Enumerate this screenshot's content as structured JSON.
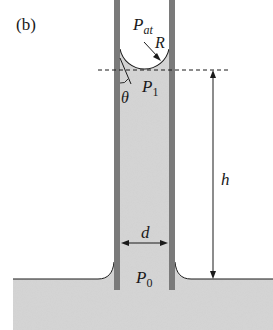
{
  "panel_label": "(b)",
  "labels": {
    "pressure_atmospheric": "P",
    "pressure_atmospheric_sub": "at",
    "radius": "R",
    "pressure_1": "P",
    "pressure_1_sub": "1",
    "contact_angle": "θ",
    "height": "h",
    "diameter": "d",
    "pressure_0": "P",
    "pressure_0_sub": "0"
  },
  "colors": {
    "liquid": "#d6d6d6",
    "tube_wall": "#7a7a7a",
    "line": "#1a1a1a",
    "background": "#ffffff"
  }
}
